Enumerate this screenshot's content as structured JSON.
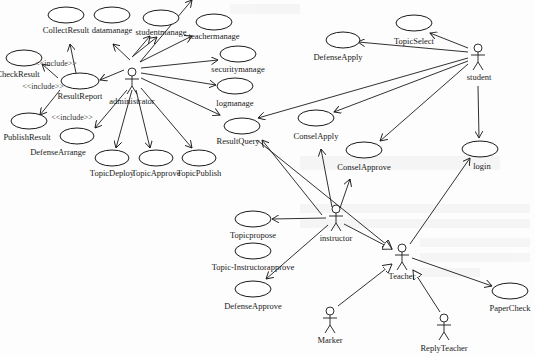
{
  "diagram": {
    "type": "uml-use-case",
    "actors": [
      {
        "id": "administrator",
        "label": "administrator",
        "x": 132,
        "y": 68
      },
      {
        "id": "student",
        "label": "student",
        "x": 478,
        "y": 45
      },
      {
        "id": "instructor",
        "label": "instructor",
        "x": 336,
        "y": 221
      },
      {
        "id": "teacher",
        "label": "Teacher",
        "x": 402,
        "y": 256
      },
      {
        "id": "marker",
        "label": "Marker",
        "x": 330,
        "y": 316
      },
      {
        "id": "replyteacher",
        "label": "ReplyTeacher",
        "x": 442,
        "y": 326
      }
    ],
    "use_cases": [
      {
        "id": "collectresult",
        "label": "CollectResult",
        "x": 66,
        "y": 15
      },
      {
        "id": "datamanage",
        "label": "datamanage",
        "x": 112,
        "y": 15
      },
      {
        "id": "studentmanage",
        "label": "studentmanage",
        "x": 161,
        "y": 18
      },
      {
        "id": "teachermanage",
        "label": "teachermanage",
        "x": 214,
        "y": 25
      },
      {
        "id": "securitymanage",
        "label": "securitymanage",
        "x": 238,
        "y": 54
      },
      {
        "id": "logmanage",
        "label": "logmanage",
        "x": 235,
        "y": 89
      },
      {
        "id": "checkresult",
        "label": "CheckResult",
        "x": 24,
        "y": 58
      },
      {
        "id": "resultreport",
        "label": "ResultReport",
        "x": 71,
        "y": 82
      },
      {
        "id": "publishresult",
        "label": "PublishResult",
        "x": 29,
        "y": 127
      },
      {
        "id": "defensearrange",
        "label": "DefenseArrange",
        "x": 78,
        "y": 139
      },
      {
        "id": "topicdeploy",
        "label": "TopicDeploy",
        "x": 112,
        "y": 160
      },
      {
        "id": "topicapprove",
        "label": "TopicApprove",
        "x": 161,
        "y": 160
      },
      {
        "id": "topicpublish",
        "label": "TopicPublish",
        "x": 211,
        "y": 160
      },
      {
        "id": "resultquery",
        "label": "ResultQuery",
        "x": 245,
        "y": 126
      },
      {
        "id": "defenseapply",
        "label": "DefenseApply",
        "x": 343,
        "y": 40
      },
      {
        "id": "topicselect",
        "label": "TopicSelect",
        "x": 414,
        "y": 23
      },
      {
        "id": "conselapply",
        "label": "ConselApply",
        "x": 316,
        "y": 118
      },
      {
        "id": "conselapprove",
        "label": "ConselApprove",
        "x": 362,
        "y": 150
      },
      {
        "id": "login",
        "label": "login",
        "x": 480,
        "y": 149
      },
      {
        "id": "topicpropose",
        "label": "Topicpropose",
        "x": 253,
        "y": 219
      },
      {
        "id": "topicinstructorapprove",
        "label": "Topic-Instructorapprove",
        "x": 253,
        "y": 251
      },
      {
        "id": "defenseapprove",
        "label": "DefenseApprove",
        "x": 253,
        "y": 289
      },
      {
        "id": "papercheck",
        "label": "PaperCheck",
        "x": 511,
        "y": 294
      }
    ],
    "stereotypes": [
      {
        "label": "<<include>>",
        "x": 55,
        "y": 65
      },
      {
        "label": "<<include>>",
        "x": 48,
        "y": 87
      },
      {
        "label": "<<include>>",
        "x": 70,
        "y": 118
      }
    ]
  }
}
